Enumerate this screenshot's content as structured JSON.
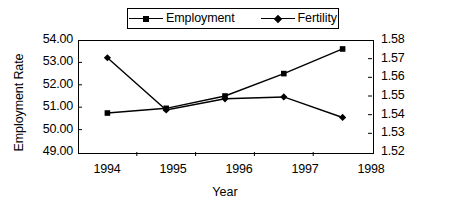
{
  "chart_data": {
    "type": "line",
    "title": "",
    "xlabel": "Year",
    "ylabel": "Employment Rate",
    "ylabel_secondary": "Fertility",
    "categories": [
      "1994",
      "1995",
      "1996",
      "1997",
      "1998"
    ],
    "x": [
      1994,
      1995,
      1996,
      1997,
      1998
    ],
    "grid": false,
    "legend_position": "top-center",
    "ylim": [
      49.0,
      54.0
    ],
    "ylim_secondary": [
      1.52,
      1.58
    ],
    "yticks": [
      "49.00",
      "50.00",
      "51.00",
      "52.00",
      "53.00",
      "54.00"
    ],
    "yticks_secondary": [
      "1.52",
      "1.53",
      "1.54",
      "1.55",
      "1.56",
      "1.57",
      "1.58"
    ],
    "series": [
      {
        "name": "Employment",
        "axis": "left",
        "marker": "square",
        "color": "#000000",
        "values": [
          50.74,
          50.95,
          51.5,
          52.5,
          53.6
        ]
      },
      {
        "name": "Fertility",
        "axis": "right",
        "marker": "diamond",
        "color": "#000000",
        "values": [
          1.5705,
          1.5425,
          1.5485,
          1.5495,
          1.5385
        ]
      }
    ]
  },
  "legend": {
    "entries": [
      {
        "label": "Employment",
        "marker": "square-marker-icon"
      },
      {
        "label": "Fertility",
        "marker": "diamond-marker-icon"
      }
    ]
  },
  "axes": {
    "left_title": "Employment Rate",
    "bottom_title": "Year",
    "left_ticks": [
      "54.00",
      "53.00",
      "52.00",
      "51.00",
      "50.00",
      "49.00"
    ],
    "right_ticks": [
      "1.58",
      "1.57",
      "1.56",
      "1.55",
      "1.54",
      "1.53",
      "1.52"
    ],
    "x_ticks": [
      "1994",
      "1995",
      "1996",
      "1997",
      "1998"
    ]
  },
  "marginalia": {
    "edge_text": ""
  }
}
